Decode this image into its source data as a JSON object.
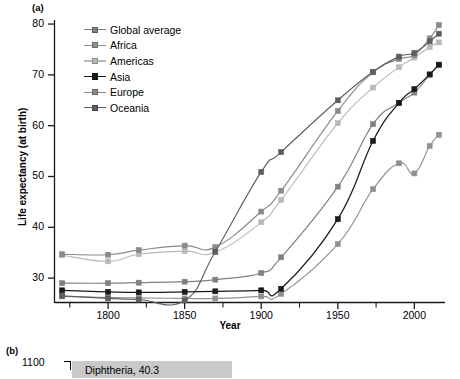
{
  "panel_a": {
    "label": "(a)",
    "axes": {
      "ylabel": "Life expectancy (at birth)",
      "xlabel": "Year",
      "yticks": [
        30,
        40,
        50,
        60,
        70,
        80
      ],
      "xticks": [
        1800,
        1850,
        1900,
        1950,
        2000
      ],
      "xminor": [
        1775,
        1825,
        1875,
        1925,
        1975
      ],
      "xlim": [
        1765,
        2020
      ],
      "ylim": [
        25.2,
        80.8
      ]
    },
    "legend": [
      {
        "label": "Global average",
        "color": "#808080"
      },
      {
        "label": "Africa",
        "color": "#919191"
      },
      {
        "label": "Americas",
        "color": "#b9b9b9"
      },
      {
        "label": "Asia",
        "color": "#1a1a1a"
      },
      {
        "label": "Europe",
        "color": "#8a8a8a"
      },
      {
        "label": "Oceania",
        "color": "#5e5e5e"
      }
    ]
  },
  "panel_b": {
    "label": "(b)",
    "ytick_label": "1100",
    "bar_label": "Diphtheria, 40.3"
  },
  "chart_data": {
    "type": "line",
    "title": "",
    "xlabel": "Year",
    "ylabel": "Life expectancy (at birth)",
    "xlim": [
      1765,
      2020
    ],
    "ylim": [
      25.2,
      80.8
    ],
    "grid": false,
    "legend_position": "top-left-inside",
    "xticks": [
      1800,
      1850,
      1900,
      1950,
      2000
    ],
    "yticks": [
      30,
      40,
      50,
      60,
      70,
      80
    ],
    "series": [
      {
        "name": "Global average",
        "color": "#808080",
        "x": [
          1770,
          1800,
          1820,
          1850,
          1870,
          1900,
          1913,
          1950,
          1973,
          1990,
          2000,
          2010,
          2016
        ],
        "y": [
          29.0,
          29.0,
          29.1,
          29.3,
          29.7,
          31.0,
          34.1,
          48.0,
          60.3,
          64.5,
          66.5,
          70.0,
          72.0
        ]
      },
      {
        "name": "Africa",
        "color": "#919191",
        "x": [
          1770,
          1800,
          1820,
          1850,
          1870,
          1900,
          1913,
          1950,
          1973,
          1990,
          2000,
          2010,
          2016
        ],
        "y": [
          26.4,
          26.2,
          26.1,
          26.0,
          26.0,
          26.4,
          26.9,
          36.7,
          47.5,
          52.6,
          50.6,
          56.0,
          58.2
        ]
      },
      {
        "name": "Americas",
        "color": "#b9b9b9",
        "x": [
          1770,
          1800,
          1820,
          1850,
          1870,
          1900,
          1913,
          1950,
          1973,
          1990,
          2000,
          2010,
          2016
        ],
        "y": [
          34.5,
          33.3,
          34.7,
          35.3,
          35.1,
          41.0,
          45.4,
          60.5,
          67.5,
          71.5,
          73.4,
          75.5,
          76.4
        ]
      },
      {
        "name": "Asia",
        "color": "#1a1a1a",
        "x": [
          1770,
          1800,
          1820,
          1850,
          1870,
          1900,
          1913,
          1950,
          1973,
          1990,
          2000,
          2010,
          2016
        ],
        "y": [
          27.6,
          27.3,
          27.2,
          27.3,
          27.4,
          27.6,
          27.9,
          41.6,
          57.0,
          64.5,
          67.2,
          70.1,
          72.0
        ]
      },
      {
        "name": "Europe",
        "color": "#8a8a8a",
        "x": [
          1770,
          1800,
          1820,
          1850,
          1870,
          1900,
          1913,
          1950,
          1973,
          1990,
          2000,
          2010,
          2016
        ],
        "y": [
          34.7,
          34.6,
          35.5,
          36.4,
          36.1,
          43.1,
          47.2,
          62.9,
          70.5,
          73.1,
          73.9,
          77.2,
          79.8
        ]
      },
      {
        "name": "Oceania",
        "color": "#5e5e5e",
        "x": [
          1770,
          1800,
          1820,
          1850,
          1870,
          1900,
          1913,
          1950,
          1973,
          1990,
          2000,
          2010,
          2016
        ],
        "y": [
          26.5,
          26.0,
          25.8,
          25.6,
          35.2,
          50.9,
          54.8,
          65.0,
          70.6,
          73.6,
          74.3,
          76.6,
          78.1
        ]
      }
    ]
  }
}
